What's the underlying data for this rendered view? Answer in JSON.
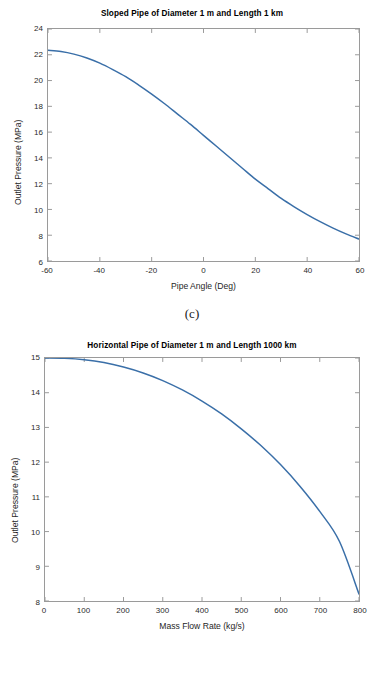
{
  "page": {
    "background": "#ffffff",
    "accent": "#3a6fa8"
  },
  "panels": [
    {
      "id": "c",
      "caption": "(c)",
      "chart_data": {
        "type": "line",
        "title": "Sloped Pipe of Diameter 1 m and Length 1 km",
        "xlabel": "Pipe Angle (Deg)",
        "ylabel": "Outlet Pressure (MPa)",
        "xlim": [
          -60,
          60
        ],
        "ylim": [
          6,
          24
        ],
        "xticks": [
          -60,
          -40,
          -20,
          0,
          20,
          40,
          60
        ],
        "yticks": [
          6,
          8,
          10,
          12,
          14,
          16,
          18,
          20,
          22,
          24
        ],
        "grid": false,
        "legend": null,
        "line_color": "#3a6fa8",
        "series": [
          {
            "name": "Outlet Pressure",
            "x": [
              -60,
              -55,
              -50,
              -45,
              -40,
              -35,
              -30,
              -25,
              -20,
              -15,
              -10,
              -5,
              0,
              5,
              10,
              15,
              20,
              25,
              30,
              35,
              40,
              45,
              50,
              55,
              60
            ],
            "values": [
              22.35,
              22.25,
              22.05,
              21.75,
              21.35,
              20.85,
              20.3,
              19.65,
              18.95,
              18.2,
              17.4,
              16.6,
              15.75,
              14.9,
              14.05,
              13.2,
              12.35,
              11.6,
              10.85,
              10.2,
              9.6,
              9.05,
              8.55,
              8.1,
              7.7
            ]
          }
        ]
      }
    },
    {
      "id": "d",
      "caption": "(d)",
      "chart_data": {
        "type": "line",
        "title": "Horizontal Pipe of Diameter 1 m and Length 1000 km",
        "xlabel": "Mass Flow Rate (kg/s)",
        "ylabel": "Outlet Pressure (MPa)",
        "xlim": [
          0,
          800
        ],
        "ylim": [
          8,
          15
        ],
        "xticks": [
          0,
          100,
          200,
          300,
          400,
          500,
          600,
          700,
          800
        ],
        "yticks": [
          8,
          9,
          10,
          11,
          12,
          13,
          14,
          15
        ],
        "grid": false,
        "legend": null,
        "line_color": "#3a6fa8",
        "series": [
          {
            "name": "Outlet Pressure",
            "x": [
              0,
              50,
              100,
              150,
              200,
              250,
              300,
              350,
              400,
              450,
              500,
              550,
              600,
              650,
              700,
              750,
              800
            ],
            "values": [
              15.0,
              14.99,
              14.95,
              14.87,
              14.74,
              14.57,
              14.35,
              14.08,
              13.76,
              13.39,
              12.96,
              12.48,
              11.93,
              11.3,
              10.58,
              9.72,
              8.2
            ]
          }
        ]
      }
    }
  ]
}
